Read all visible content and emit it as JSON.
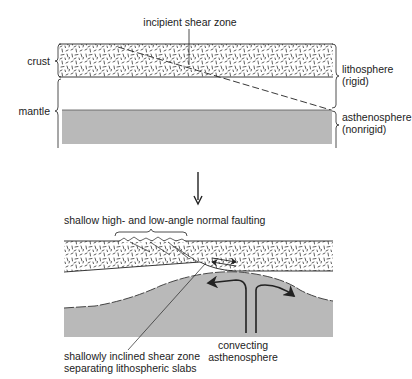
{
  "figure": {
    "top_panel": {
      "labels": {
        "incipient_shear_zone": "incipient shear zone",
        "crust": "crust",
        "mantle": "mantle",
        "lithosphere": "lithosphere",
        "lithosphere_note": "(rigid)",
        "asthenosphere": "asthenosphere",
        "asthenosphere_note": "(nonrigid)"
      }
    },
    "transition_arrow": "down-arrow",
    "bottom_panel": {
      "labels": {
        "normal_faulting": "shallow high- and low-angle normal faulting",
        "shear_zone_line1": "shallowly inclined shear zone",
        "shear_zone_line2": "separating lithospheric slabs",
        "convecting_line1": "convecting",
        "convecting_line2": "asthenosphere"
      }
    },
    "colors": {
      "asthenosphere_fill": "#b9b9b9",
      "line": "#222222",
      "background": "#ffffff"
    }
  }
}
